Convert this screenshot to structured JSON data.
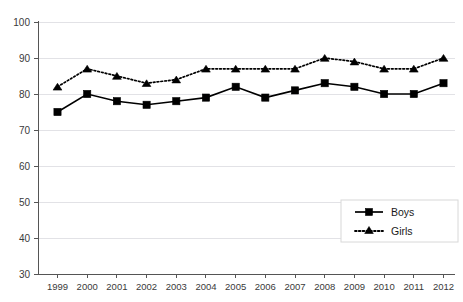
{
  "chart_data": {
    "type": "line",
    "title": "",
    "subtitle": "",
    "xlabel": "",
    "ylabel": "",
    "categories": [
      "1999",
      "2000",
      "2001",
      "2002",
      "2003",
      "2004",
      "2005",
      "2006",
      "2007",
      "2008",
      "2009",
      "2010",
      "2011",
      "2012"
    ],
    "series": [
      {
        "name": "Boys",
        "marker": "square",
        "linestyle": "solid",
        "color": "#000000",
        "values": [
          75,
          80,
          78,
          77,
          78,
          79,
          82,
          79,
          81,
          83,
          82,
          80,
          80,
          83
        ]
      },
      {
        "name": "Girls",
        "marker": "triangle",
        "linestyle": "dotted",
        "color": "#000000",
        "values": [
          82,
          87,
          85,
          83,
          84,
          87,
          87,
          87,
          87,
          90,
          89,
          87,
          87,
          90
        ]
      }
    ],
    "ylim": [
      30,
      100
    ],
    "yticks": [
      30,
      40,
      50,
      60,
      70,
      80,
      90,
      100
    ],
    "ytick_labels": [
      "30",
      "40",
      "50",
      "60",
      "70",
      "80",
      "90",
      "100"
    ],
    "grid": true,
    "grid_axis": "y",
    "legend_position": "inside-lower-right",
    "legend_entries": [
      "Boys",
      "Girls"
    ],
    "gridline_color": "#e2e2e6",
    "axis_color": "#555555"
  },
  "axis": {
    "y_tick_labels": [
      "100",
      "90",
      "80",
      "70",
      "60",
      "50",
      "40",
      "30"
    ],
    "x_tick_labels": [
      "1999",
      "2000",
      "2001",
      "2002",
      "2003",
      "2004",
      "2005",
      "2006",
      "2007",
      "2008",
      "2009",
      "2010",
      "2011",
      "2012"
    ]
  },
  "legend": {
    "boys_label": "Boys",
    "girls_label": "Girls"
  }
}
